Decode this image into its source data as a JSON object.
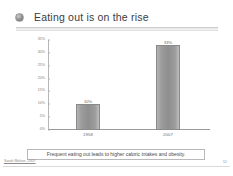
{
  "slide": {
    "title": "Eating out is on the rise",
    "bullet_icon": "circle-bullet-icon",
    "caption": "Frequent eating out leads to higher caloric intakes and obesity.",
    "footer_credit": "Sarah Mahan, 2007",
    "page_number": "11"
  },
  "chart_data": {
    "type": "bar",
    "title": "",
    "categories": [
      "1958",
      "2007"
    ],
    "values": [
      10,
      33
    ],
    "value_labels": [
      "10%",
      "33%"
    ],
    "xlabel": "",
    "ylabel": "",
    "ylim": [
      0,
      35
    ],
    "yticks": [
      0,
      5,
      10,
      15,
      20,
      25,
      30,
      35
    ],
    "ytick_labels": [
      "0%",
      "5%",
      "10%",
      "15%",
      "20%",
      "25%",
      "30%",
      "35%"
    ],
    "grid": false,
    "legend": false,
    "bar_color": "#9a9a9a",
    "axis_color": "#9a9a9a",
    "label_color": "#7a7a7a"
  }
}
